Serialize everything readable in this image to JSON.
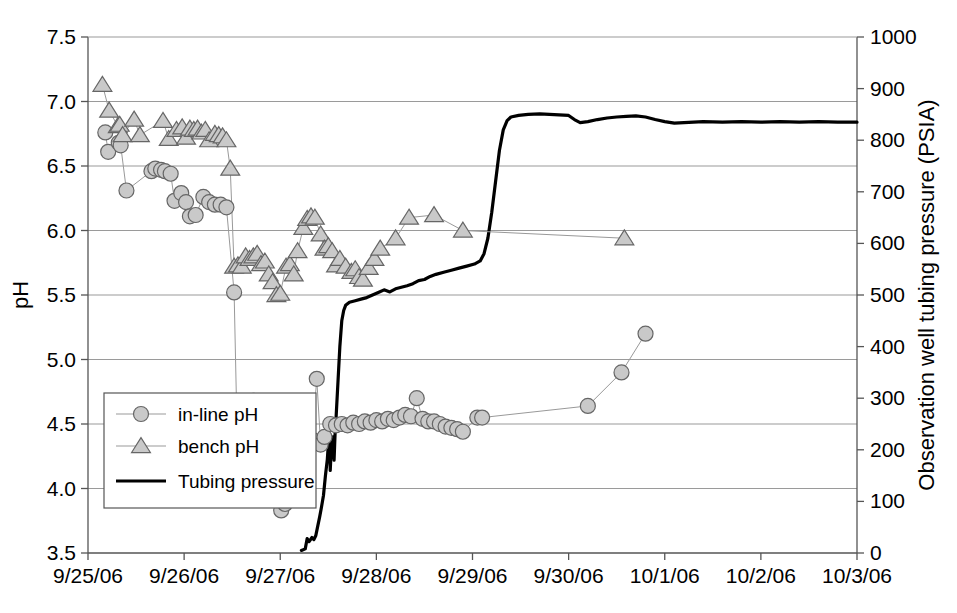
{
  "chart_data": {
    "type": "line",
    "title": "",
    "xlabel": "",
    "ylabel": "pH",
    "y2label": "Observation well tubing pressure (PSIA)",
    "grid": true,
    "legend_position": "inside-lower-left",
    "x_tick_labels": [
      "9/25/06",
      "9/26/06",
      "9/27/06",
      "9/28/06",
      "9/29/06",
      "9/30/06",
      "10/1/06",
      "10/2/06",
      "10/3/06"
    ],
    "xlim": [
      0,
      8
    ],
    "ylim": [
      3.5,
      7.5
    ],
    "y_tick_labels": [
      "3.5",
      "4.0",
      "4.5",
      "5.0",
      "5.5",
      "6.0",
      "6.5",
      "7.0",
      "7.5"
    ],
    "y2lim": [
      0,
      1000
    ],
    "y2_tick_labels": [
      "0",
      "100",
      "200",
      "300",
      "400",
      "500",
      "600",
      "700",
      "800",
      "900",
      "1000"
    ],
    "colors": {
      "marker_fill": "#c9c9c9",
      "marker_stroke": "#666666",
      "connector_line": "#999999",
      "pressure_line": "#000000",
      "grid": "#9a9a9a",
      "axis": "#555555"
    },
    "series": [
      {
        "name": "in-line pH",
        "marker": "circle",
        "axis": "left",
        "points": [
          [
            0.18,
            6.76
          ],
          [
            0.21,
            6.61
          ],
          [
            0.32,
            6.68
          ],
          [
            0.34,
            6.66
          ],
          [
            0.4,
            6.31
          ],
          [
            0.66,
            6.46
          ],
          [
            0.7,
            6.48
          ],
          [
            0.76,
            6.47
          ],
          [
            0.8,
            6.46
          ],
          [
            0.86,
            6.44
          ],
          [
            0.9,
            6.23
          ],
          [
            0.97,
            6.29
          ],
          [
            1.02,
            6.22
          ],
          [
            1.06,
            6.11
          ],
          [
            1.12,
            6.12
          ],
          [
            1.2,
            6.26
          ],
          [
            1.26,
            6.22
          ],
          [
            1.32,
            6.2
          ],
          [
            1.38,
            6.2
          ],
          [
            1.44,
            6.18
          ],
          [
            1.52,
            5.52
          ],
          [
            1.55,
            4.48
          ],
          [
            1.62,
            4.66
          ],
          [
            1.66,
            4.64
          ],
          [
            1.72,
            4.68
          ],
          [
            1.76,
            4.66
          ],
          [
            1.8,
            4.67
          ],
          [
            1.84,
            4.65
          ],
          [
            1.9,
            4.05
          ],
          [
            1.94,
            3.98
          ],
          [
            1.98,
            4.0
          ],
          [
            2.01,
            3.83
          ],
          [
            2.05,
            3.88
          ],
          [
            2.12,
            4.06
          ],
          [
            2.16,
            4.08
          ],
          [
            2.22,
            4.22
          ],
          [
            2.28,
            4.34
          ],
          [
            2.33,
            4.38
          ],
          [
            2.38,
            4.85
          ],
          [
            2.42,
            4.34
          ],
          [
            2.46,
            4.4
          ],
          [
            2.52,
            4.5
          ],
          [
            2.58,
            4.49
          ],
          [
            2.64,
            4.5
          ],
          [
            2.7,
            4.49
          ],
          [
            2.76,
            4.51
          ],
          [
            2.82,
            4.5
          ],
          [
            2.88,
            4.52
          ],
          [
            2.94,
            4.51
          ],
          [
            3.0,
            4.53
          ],
          [
            3.06,
            4.52
          ],
          [
            3.12,
            4.54
          ],
          [
            3.18,
            4.53
          ],
          [
            3.24,
            4.55
          ],
          [
            3.3,
            4.57
          ],
          [
            3.36,
            4.56
          ],
          [
            3.42,
            4.7
          ],
          [
            3.48,
            4.54
          ],
          [
            3.54,
            4.52
          ],
          [
            3.6,
            4.52
          ],
          [
            3.66,
            4.5
          ],
          [
            3.72,
            4.48
          ],
          [
            3.78,
            4.47
          ],
          [
            3.84,
            4.46
          ],
          [
            3.9,
            4.44
          ],
          [
            4.05,
            4.55
          ],
          [
            4.1,
            4.55
          ],
          [
            5.2,
            4.64
          ],
          [
            5.55,
            4.9
          ],
          [
            5.8,
            5.2
          ]
        ]
      },
      {
        "name": "bench pH",
        "marker": "triangle",
        "axis": "left",
        "points": [
          [
            0.15,
            7.13
          ],
          [
            0.22,
            6.93
          ],
          [
            0.31,
            6.81
          ],
          [
            0.33,
            6.82
          ],
          [
            0.36,
            6.74
          ],
          [
            0.48,
            6.86
          ],
          [
            0.54,
            6.74
          ],
          [
            0.78,
            6.85
          ],
          [
            0.84,
            6.71
          ],
          [
            0.92,
            6.78
          ],
          [
            0.98,
            6.8
          ],
          [
            1.02,
            6.72
          ],
          [
            1.06,
            6.79
          ],
          [
            1.1,
            6.78
          ],
          [
            1.14,
            6.79
          ],
          [
            1.18,
            6.76
          ],
          [
            1.22,
            6.78
          ],
          [
            1.26,
            6.7
          ],
          [
            1.32,
            6.75
          ],
          [
            1.36,
            6.74
          ],
          [
            1.4,
            6.73
          ],
          [
            1.44,
            6.7
          ],
          [
            1.48,
            6.48
          ],
          [
            1.52,
            5.72
          ],
          [
            1.56,
            5.73
          ],
          [
            1.6,
            5.72
          ],
          [
            1.64,
            5.8
          ],
          [
            1.68,
            5.78
          ],
          [
            1.72,
            5.8
          ],
          [
            1.76,
            5.82
          ],
          [
            1.8,
            5.74
          ],
          [
            1.84,
            5.76
          ],
          [
            1.88,
            5.66
          ],
          [
            1.92,
            5.6
          ],
          [
            1.96,
            5.5
          ],
          [
            2.0,
            5.51
          ],
          [
            2.06,
            5.72
          ],
          [
            2.1,
            5.74
          ],
          [
            2.14,
            5.66
          ],
          [
            2.18,
            5.84
          ],
          [
            2.24,
            6.02
          ],
          [
            2.28,
            6.09
          ],
          [
            2.32,
            6.11
          ],
          [
            2.36,
            6.1
          ],
          [
            2.42,
            5.97
          ],
          [
            2.46,
            5.86
          ],
          [
            2.5,
            5.88
          ],
          [
            2.54,
            5.84
          ],
          [
            2.58,
            5.73
          ],
          [
            2.62,
            5.78
          ],
          [
            2.68,
            5.72
          ],
          [
            2.74,
            5.68
          ],
          [
            2.78,
            5.7
          ],
          [
            2.82,
            5.64
          ],
          [
            2.86,
            5.62
          ],
          [
            2.92,
            5.71
          ],
          [
            2.98,
            5.78
          ],
          [
            3.04,
            5.86
          ],
          [
            3.2,
            5.94
          ],
          [
            3.34,
            6.1
          ],
          [
            3.6,
            6.12
          ],
          [
            3.9,
            6.0
          ],
          [
            5.58,
            5.94
          ]
        ]
      }
    ],
    "pressure_series": {
      "name": "Tubing pressure",
      "axis": "right",
      "points": [
        [
          2.22,
          5
        ],
        [
          2.26,
          8
        ],
        [
          2.28,
          28
        ],
        [
          2.3,
          22
        ],
        [
          2.33,
          30
        ],
        [
          2.35,
          26
        ],
        [
          2.37,
          34
        ],
        [
          2.39,
          52
        ],
        [
          2.41,
          70
        ],
        [
          2.43,
          90
        ],
        [
          2.45,
          112
        ],
        [
          2.47,
          150
        ],
        [
          2.49,
          182
        ],
        [
          2.5,
          210
        ],
        [
          2.515,
          218
        ],
        [
          2.52,
          160
        ],
        [
          2.53,
          200
        ],
        [
          2.54,
          215
        ],
        [
          2.55,
          225
        ],
        [
          2.56,
          180
        ],
        [
          2.57,
          230
        ],
        [
          2.58,
          260
        ],
        [
          2.6,
          330
        ],
        [
          2.62,
          400
        ],
        [
          2.64,
          450
        ],
        [
          2.66,
          470
        ],
        [
          2.68,
          480
        ],
        [
          2.72,
          486
        ],
        [
          2.78,
          489
        ],
        [
          2.84,
          492
        ],
        [
          2.9,
          495
        ],
        [
          2.96,
          500
        ],
        [
          3.02,
          505
        ],
        [
          3.08,
          510
        ],
        [
          3.14,
          506
        ],
        [
          3.2,
          512
        ],
        [
          3.26,
          515
        ],
        [
          3.32,
          518
        ],
        [
          3.38,
          522
        ],
        [
          3.44,
          528
        ],
        [
          3.5,
          530
        ],
        [
          3.56,
          536
        ],
        [
          3.62,
          540
        ],
        [
          3.7,
          544
        ],
        [
          3.78,
          548
        ],
        [
          3.86,
          552
        ],
        [
          3.94,
          556
        ],
        [
          4.02,
          560
        ],
        [
          4.08,
          566
        ],
        [
          4.12,
          580
        ],
        [
          4.16,
          610
        ],
        [
          4.2,
          660
        ],
        [
          4.24,
          720
        ],
        [
          4.28,
          780
        ],
        [
          4.32,
          820
        ],
        [
          4.36,
          838
        ],
        [
          4.4,
          845
        ],
        [
          4.48,
          848
        ],
        [
          4.58,
          850
        ],
        [
          4.7,
          851
        ],
        [
          4.8,
          850
        ],
        [
          4.9,
          849
        ],
        [
          5.0,
          848
        ],
        [
          5.06,
          840
        ],
        [
          5.12,
          834
        ],
        [
          5.2,
          836
        ],
        [
          5.3,
          840
        ],
        [
          5.4,
          843
        ],
        [
          5.5,
          845
        ],
        [
          5.6,
          846
        ],
        [
          5.7,
          847
        ],
        [
          5.8,
          845
        ],
        [
          5.9,
          840
        ],
        [
          6.0,
          836
        ],
        [
          6.1,
          833
        ],
        [
          6.2,
          834
        ],
        [
          6.4,
          836
        ],
        [
          6.6,
          835
        ],
        [
          6.8,
          836
        ],
        [
          7.0,
          835
        ],
        [
          7.2,
          836
        ],
        [
          7.4,
          835
        ],
        [
          7.6,
          836
        ],
        [
          7.8,
          835
        ],
        [
          8.0,
          835
        ]
      ]
    }
  },
  "legend": {
    "items": [
      {
        "label": "in-line pH",
        "marker": "circle"
      },
      {
        "label": "bench pH",
        "marker": "triangle"
      },
      {
        "label": "Tubing pressure",
        "marker": "line"
      }
    ]
  }
}
